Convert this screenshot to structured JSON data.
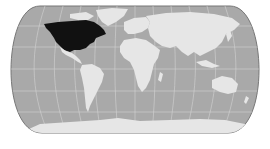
{
  "map": {
    "projection": "pseudocylindrical world map (rounded edges)",
    "highlighted_region": "North America (United States and Canada)",
    "colors": {
      "background": "#ffffff",
      "ocean": "#a9a9a9",
      "land": "#e6e6e6",
      "highlight": "#111111",
      "graticule": "#d4d4d4",
      "border": "#777777"
    },
    "regions": [
      {
        "name": "North America (USA & Canada)",
        "highlighted": true
      },
      {
        "name": "Greenland",
        "highlighted": false
      },
      {
        "name": "Mexico & Central America",
        "highlighted": false
      },
      {
        "name": "South America",
        "highlighted": false
      },
      {
        "name": "Europe",
        "highlighted": false
      },
      {
        "name": "Africa",
        "highlighted": false
      },
      {
        "name": "Asia",
        "highlighted": false
      },
      {
        "name": "Australia",
        "highlighted": false
      },
      {
        "name": "Antarctica",
        "highlighted": false
      }
    ]
  }
}
